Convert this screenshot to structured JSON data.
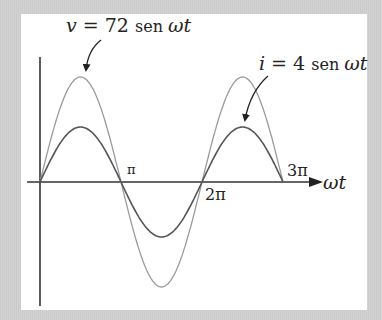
{
  "labels": {
    "voltage": {
      "var": "v",
      "eq": " = 72 ",
      "fn": "sen ",
      "arg": "ωt"
    },
    "current": {
      "var": "i",
      "eq": " = 4 ",
      "fn": "sen ",
      "arg": "ωt"
    },
    "pi": "π",
    "two_pi": "2π",
    "three_pi": "3π",
    "x_axis": "ωt"
  },
  "colors": {
    "voltage": "#9a9a9a",
    "current": "#555555",
    "axis": "#333333",
    "background": "#cfcfcf",
    "panel": "#ffffff"
  },
  "chart_data": {
    "type": "line",
    "title": "",
    "xlabel": "ωt",
    "ylabel": "",
    "x_ticks": [
      "π",
      "2π",
      "3π"
    ],
    "x_range": [
      0,
      "3π"
    ],
    "series": [
      {
        "name": "v = 72 sen ωt",
        "amplitude": 72,
        "function": "72 sin(ωt)",
        "x": [
          0,
          1.5708,
          3.1416,
          4.7124,
          6.2832,
          7.854,
          9.4248
        ],
        "values": [
          0,
          72,
          0,
          -72,
          0,
          72,
          0
        ]
      },
      {
        "name": "i = 4 sen ωt",
        "amplitude": 4,
        "function": "4 sin(ωt)",
        "x": [
          0,
          1.5708,
          3.1416,
          4.7124,
          6.2832,
          7.854,
          9.4248
        ],
        "values": [
          0,
          4,
          0,
          -4,
          0,
          4,
          0
        ]
      }
    ],
    "grid": false,
    "legend": "annotations with arrows"
  }
}
